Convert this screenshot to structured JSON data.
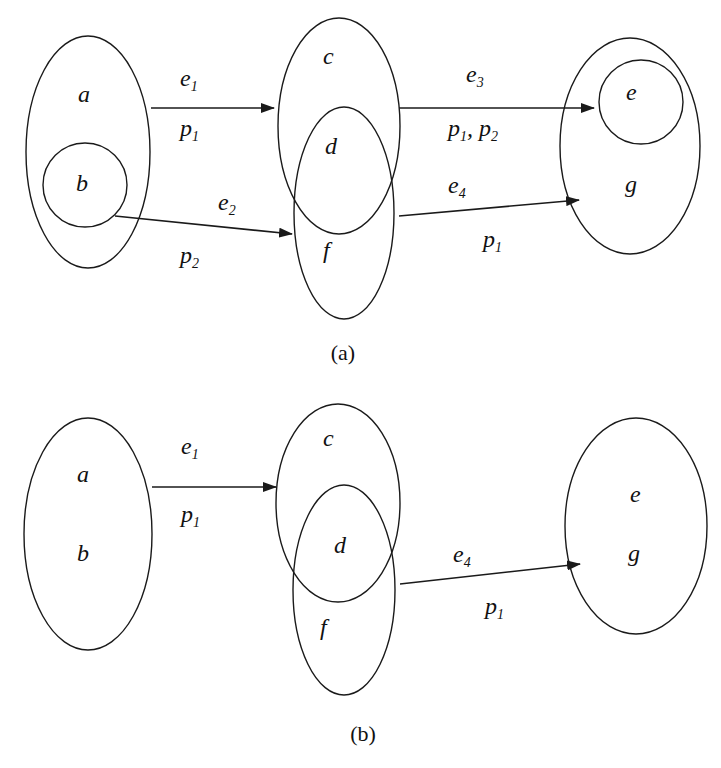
{
  "figure": {
    "panel_a": {
      "caption": "(a)",
      "nodes": {
        "a": "a",
        "b": "b",
        "c": "c",
        "d": "d",
        "e": "e",
        "f": "f",
        "g": "g"
      },
      "edges": [
        {
          "id": "e1",
          "label": "e",
          "label_sub": "1",
          "prop": "p",
          "prop_sub": "1",
          "prop_rest": ""
        },
        {
          "id": "e2",
          "label": "e",
          "label_sub": "2",
          "prop": "p",
          "prop_sub": "2",
          "prop_rest": ""
        },
        {
          "id": "e3",
          "label": "e",
          "label_sub": "3",
          "prop": "p",
          "prop_sub": "1",
          "prop_rest": ", p",
          "prop_rest_sub": "2"
        },
        {
          "id": "e4",
          "label": "e",
          "label_sub": "4",
          "prop": "p",
          "prop_sub": "1",
          "prop_rest": ""
        }
      ]
    },
    "panel_b": {
      "caption": "(b)",
      "nodes": {
        "a": "a",
        "b": "b",
        "c": "c",
        "d": "d",
        "e": "e",
        "f": "f",
        "g": "g"
      },
      "edges": [
        {
          "id": "e1",
          "label": "e",
          "label_sub": "1",
          "prop": "p",
          "prop_sub": "1"
        },
        {
          "id": "e4",
          "label": "e",
          "label_sub": "4",
          "prop": "p",
          "prop_sub": "1"
        }
      ]
    },
    "colors": {
      "stroke": "#1a1a1a",
      "background": "#ffffff"
    }
  }
}
